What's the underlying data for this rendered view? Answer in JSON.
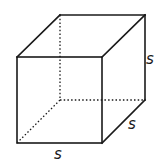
{
  "diagram": {
    "shape": "cube",
    "colors": {
      "stroke": "#1a1a1a",
      "background": "#ffffff"
    },
    "vertices": {
      "front_top_left": [
        17,
        57
      ],
      "front_top_right": [
        102,
        57
      ],
      "front_bottom_left": [
        17,
        143
      ],
      "front_bottom_right": [
        102,
        143
      ],
      "back_top_left": [
        60,
        15
      ],
      "back_top_right": [
        145,
        15
      ],
      "back_bottom_left": [
        60,
        100
      ],
      "back_bottom_right": [
        145,
        100
      ]
    },
    "labels": {
      "bottom": "s",
      "depth": "s",
      "height": "s"
    }
  }
}
